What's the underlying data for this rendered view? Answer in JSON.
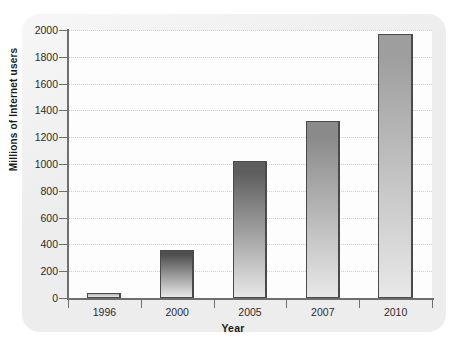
{
  "chart_data": {
    "type": "bar",
    "title": "",
    "xlabel": "Year",
    "ylabel": "Millions of Internet users",
    "categories": [
      "1996",
      "2000",
      "2005",
      "2007",
      "2010"
    ],
    "values": [
      36,
      360,
      1020,
      1320,
      1970
    ],
    "ylim": [
      0,
      2000
    ],
    "ytick_step": 200,
    "yticks": [
      "0",
      "200",
      "400",
      "600",
      "800",
      "1000",
      "1200",
      "1400",
      "1600",
      "1800",
      "2000"
    ],
    "grid": "horizontal-dotted",
    "legend": "none",
    "bar_colors": [
      "#b9b9b9",
      "#4f4f4f",
      "#5e5e5e",
      "#8a8a8a",
      "#9e9e9e"
    ],
    "bar_gradient": "dark top to light bottom",
    "series": [
      {
        "name": "Internet users",
        "values": [
          36,
          360,
          1020,
          1320,
          1970
        ]
      }
    ]
  },
  "style": {
    "card_background": "#ededed",
    "plot_background": "#fdfdfd",
    "axis_color": "#6f6f6f",
    "grid_color": "#cfcfcf",
    "text_color": "#1b1b1b"
  }
}
